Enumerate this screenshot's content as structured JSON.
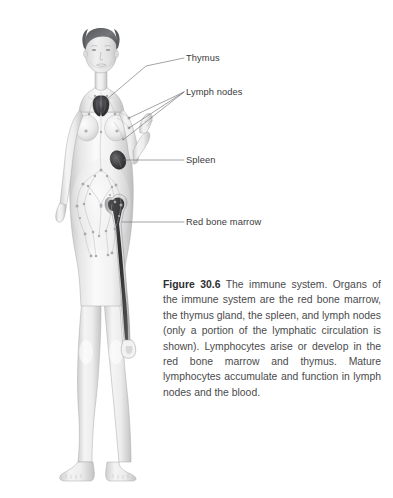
{
  "figure": {
    "background_color": "#ffffff",
    "label_color": "#3a3a3c",
    "caption_color": "#4a4a4c",
    "leader_line_color": "#6b6b6e",
    "illustration_alt": "grayscale-female-body-immune-system-illustration"
  },
  "callouts": [
    {
      "id": "thymus",
      "label": "Thymus",
      "icon": "leader-line-icon"
    },
    {
      "id": "lymph-nodes",
      "label": "Lymph nodes",
      "icon": "leader-line-branched-icon"
    },
    {
      "id": "spleen",
      "label": "Spleen",
      "icon": "leader-line-icon"
    },
    {
      "id": "red-bone-marrow",
      "label": "Red bone marrow",
      "icon": "leader-line-icon"
    }
  ],
  "caption": {
    "lead": "Figure 30.6",
    "body": "The immune system. Organs of the immune system are the red bone marrow, the thymus gland, the spleen, and lymph nodes (only a portion of the lymphatic circulation is shown). Lymphocytes arise or develop in the red bone marrow and thymus. Mature lymphocytes accumulate and function in lymph nodes and the blood."
  },
  "anatomy_parts": [
    {
      "name": "thymus",
      "description": "butterfly-shaped dark organ at the base of the neck"
    },
    {
      "name": "lymph-nodes",
      "description": "stippled nodes along lymphatic vessels of neck, axilla and abdomen"
    },
    {
      "name": "spleen",
      "description": "dark oval organ in the left upper abdomen"
    },
    {
      "name": "red-bone-marrow",
      "description": "dark marrow cavity within the femur"
    },
    {
      "name": "lymphatic-vessels",
      "description": "fine branching network across the abdomen and pelvis"
    }
  ]
}
